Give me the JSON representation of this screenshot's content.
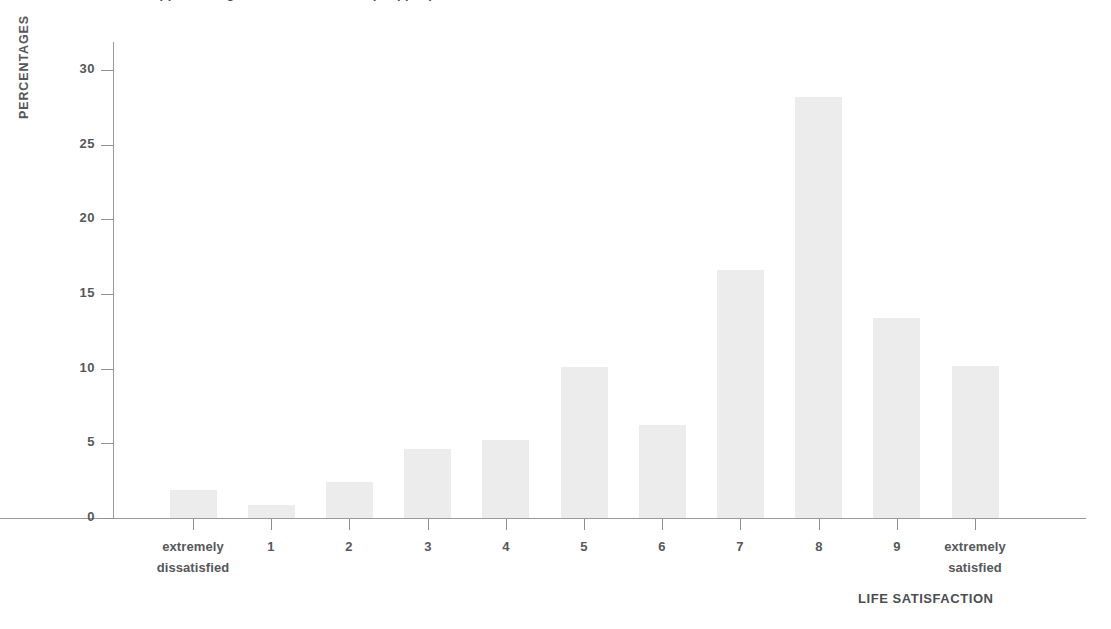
{
  "figure": {
    "title_partial": "Appendix Figure: Life Satisfaction (cropped)",
    "background_color": "#ffffff",
    "bar_color": "#ececec",
    "axis_color": "#9a9a9a",
    "text_color": "#56575a"
  },
  "chart_data": {
    "type": "bar",
    "title": "",
    "xlabel": "LIFE SATISFACTION",
    "ylabel": "PERCENTAGES",
    "categories": [
      "extremely dissatisfied",
      "1",
      "2",
      "3",
      "4",
      "5",
      "6",
      "7",
      "8",
      "9",
      "extremely satisfied"
    ],
    "category_lines": [
      [
        "extremely",
        "dissatisfied"
      ],
      [
        "1",
        ""
      ],
      [
        "2",
        ""
      ],
      [
        "3",
        ""
      ],
      [
        "4",
        ""
      ],
      [
        "5",
        ""
      ],
      [
        "6",
        ""
      ],
      [
        "7",
        ""
      ],
      [
        "8",
        ""
      ],
      [
        "9",
        ""
      ],
      [
        "extremely",
        "satisfied"
      ]
    ],
    "values": [
      1.9,
      0.9,
      2.4,
      4.6,
      5.2,
      10.1,
      6.2,
      16.6,
      28.2,
      13.4,
      10.2
    ],
    "ylim": [
      0,
      31.5
    ],
    "ytick_values": [
      0,
      5,
      10,
      15,
      20,
      25,
      30
    ],
    "ytick_labels": [
      "0",
      "5",
      "10",
      "15",
      "20",
      "25",
      "30"
    ],
    "grid": false,
    "legend": "none",
    "series": [
      {
        "name": "Percentage of respondents",
        "values": [
          1.9,
          0.9,
          2.4,
          4.6,
          5.2,
          10.1,
          6.2,
          16.6,
          28.2,
          13.4,
          10.2
        ]
      }
    ]
  },
  "geometry": {
    "baseline_y": 518,
    "axis_x": 113,
    "px_per_unit": 14.93,
    "tick_start_x": 193,
    "tick_spacing": 78.2,
    "bar_width": 47
  }
}
